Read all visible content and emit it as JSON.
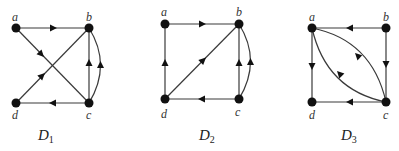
{
  "figure": {
    "graphs": [
      {
        "id": "D1",
        "caption": "D",
        "caption_sub": "1",
        "nodes": [
          {
            "label": "a",
            "x": 16,
            "y": 28
          },
          {
            "label": "b",
            "x": 89,
            "y": 28
          },
          {
            "label": "c",
            "x": 89,
            "y": 103
          },
          {
            "label": "d",
            "x": 16,
            "y": 103
          }
        ],
        "edges": [
          {
            "from": "a",
            "to": "b"
          },
          {
            "from": "a",
            "to": "c"
          },
          {
            "from": "d",
            "to": "b"
          },
          {
            "from": "c",
            "to": "d"
          },
          {
            "from": "c",
            "to": "b",
            "curved": false
          },
          {
            "from": "c",
            "to": "b",
            "curved": true
          }
        ]
      },
      {
        "id": "D2",
        "caption": "D",
        "caption_sub": "2",
        "nodes": [
          {
            "label": "a",
            "x": 165,
            "y": 24
          },
          {
            "label": "b",
            "x": 239,
            "y": 24
          },
          {
            "label": "c",
            "x": 239,
            "y": 99
          },
          {
            "label": "d",
            "x": 165,
            "y": 99
          }
        ],
        "edges": [
          {
            "from": "a",
            "to": "b"
          },
          {
            "from": "d",
            "to": "a"
          },
          {
            "from": "d",
            "to": "b"
          },
          {
            "from": "c",
            "to": "d"
          },
          {
            "from": "c",
            "to": "b",
            "curved": false
          },
          {
            "from": "c",
            "to": "b",
            "curved": true
          }
        ]
      },
      {
        "id": "D3",
        "caption": "D",
        "caption_sub": "3",
        "nodes": [
          {
            "label": "a",
            "x": 312,
            "y": 28
          },
          {
            "label": "b",
            "x": 386,
            "y": 28
          },
          {
            "label": "c",
            "x": 386,
            "y": 102
          },
          {
            "label": "d",
            "x": 312,
            "y": 102
          }
        ],
        "edges": [
          {
            "from": "b",
            "to": "a"
          },
          {
            "from": "b",
            "to": "c"
          },
          {
            "from": "a",
            "to": "d"
          },
          {
            "from": "c",
            "to": "d"
          },
          {
            "from": "c",
            "to": "a",
            "curved": "upper"
          },
          {
            "from": "c",
            "to": "a",
            "curved": "lower"
          }
        ]
      }
    ]
  }
}
